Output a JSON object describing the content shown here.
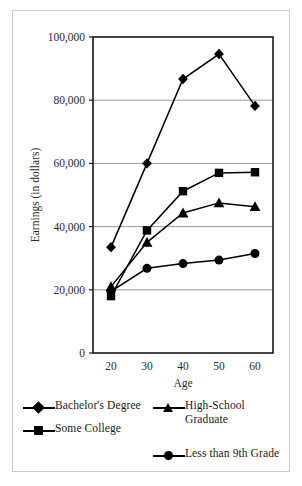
{
  "chart_data": {
    "type": "line",
    "title": "",
    "xlabel": "Age",
    "ylabel": "Earnings (in dollars)",
    "x": [
      20,
      30,
      40,
      50,
      60
    ],
    "xticklabels": [
      "20",
      "30",
      "40",
      "50",
      "60"
    ],
    "yticks": [
      0,
      20000,
      40000,
      60000,
      80000,
      100000
    ],
    "yticklabels": [
      "0",
      "20,000",
      "40,000",
      "60,000",
      "80,000",
      "100,000"
    ],
    "xlim": [
      15,
      65
    ],
    "ylim": [
      0,
      100000
    ],
    "grid": "horizontal",
    "legend_position": "bottom",
    "series": [
      {
        "name": "Bachelor's Degree",
        "marker": "diamond",
        "values": [
          33500,
          60000,
          86700,
          94600,
          78200
        ]
      },
      {
        "name": "Some College",
        "marker": "square",
        "values": [
          18000,
          38800,
          51200,
          57000,
          57200
        ]
      },
      {
        "name": "High-School Graduate",
        "marker": "triangle",
        "values": [
          21000,
          35000,
          44300,
          47500,
          46300
        ]
      },
      {
        "name": "Less than 9th Grade",
        "marker": "circle",
        "values": [
          19500,
          26800,
          28300,
          29400,
          31500
        ]
      }
    ]
  },
  "legend": {
    "left_column": [
      {
        "label": "Bachelor's Degree",
        "marker": "diamond"
      },
      {
        "label": "Some College",
        "marker": "square"
      }
    ],
    "right_column": [
      {
        "label": "High-School\nGraduate",
        "marker": "triangle"
      },
      {
        "label": "Less than 9th Grade",
        "marker": "circle"
      }
    ]
  },
  "colors": {
    "series": "#000000",
    "grid": "#9a9a9a",
    "axis": "#1a1a1a",
    "frame": "#c9c9c9",
    "background": "#ffffff"
  }
}
